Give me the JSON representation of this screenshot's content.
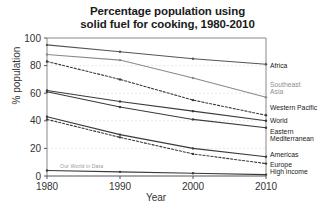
{
  "chart_data": {
    "type": "line",
    "title": "Percentage population using solid fuel for cooking, 1980-2010",
    "title_line1": "Percentage population using",
    "title_line2": "solid fuel for cooking, 1980-2010",
    "xlabel": "Year",
    "ylabel": "% population",
    "x": [
      1980,
      1990,
      2000,
      2010
    ],
    "xlim": [
      1980,
      2010
    ],
    "ylim": [
      0,
      100
    ],
    "xticks": [
      1980,
      1990,
      2000,
      2010
    ],
    "yticks": [
      0,
      20,
      40,
      60,
      80,
      100
    ],
    "grid": true,
    "legend_position": "right-inline",
    "watermark": "Our World in Data",
    "series": [
      {
        "name": "Africa",
        "values": [
          95,
          90,
          85,
          81
        ],
        "style": "solid",
        "color": "#555555",
        "label_y": 62
      },
      {
        "name": "Southeast Asia",
        "label_lines": [
          "Southeast",
          "Asia"
        ],
        "values": [
          88,
          84,
          71,
          57
        ],
        "style": "solid",
        "color": "#8a8a8a",
        "label_color": "#8f8f8f",
        "label_y": 81
      },
      {
        "name": "Western Pacific",
        "values": [
          83,
          70,
          55,
          44
        ],
        "style": "dashed",
        "color": "#3a3a3a",
        "label_y": 104
      },
      {
        "name": "World",
        "values": [
          62,
          54,
          47,
          40
        ],
        "style": "solid",
        "color": "#3a3a3a",
        "label_y": 117
      },
      {
        "name": "Eastern Mediterranean",
        "label_lines": [
          "Eastern",
          "Mediterranean"
        ],
        "values": [
          61,
          50,
          41,
          35
        ],
        "style": "solid",
        "color": "#3a3a3a",
        "label_y": 128
      },
      {
        "name": "Americas",
        "values": [
          43,
          30,
          20,
          14
        ],
        "style": "solid",
        "color": "#3a3a3a",
        "label_y": 151
      },
      {
        "name": "Europe",
        "values": [
          41,
          28,
          16,
          9
        ],
        "style": "dashed",
        "color": "#3a3a3a",
        "label_y": 161
      },
      {
        "name": "High income",
        "values": [
          4,
          3,
          2,
          1
        ],
        "style": "solid",
        "color": "#3a3a3a",
        "label_y": 168
      }
    ]
  }
}
